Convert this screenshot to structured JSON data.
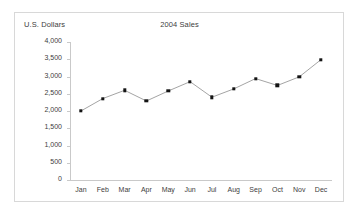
{
  "chart_data": {
    "type": "line",
    "title": "2004 Sales",
    "xlabel": "",
    "ylabel": "U.S. Dollars",
    "categories": [
      "Jan",
      "Feb",
      "Mar",
      "Apr",
      "May",
      "Jun",
      "Jul",
      "Aug",
      "Sep",
      "Oct",
      "Nov",
      "Dec"
    ],
    "values": [
      2000,
      2360,
      2600,
      2290,
      2580,
      2850,
      2400,
      2640,
      2940,
      2740,
      2990,
      3490
    ],
    "series": [
      {
        "name": "2004 Sales",
        "values": [
          2000,
          2360,
          2600,
          2290,
          2580,
          2850,
          2400,
          2640,
          2940,
          2740,
          2990,
          3490
        ]
      }
    ],
    "ylim": [
      0,
      4000
    ],
    "ytick_values": [
      4000,
      3500,
      3000,
      2500,
      2000,
      1500,
      1000,
      500,
      0
    ],
    "ytick_labels": [
      "4,000",
      "3,500",
      "3,000",
      "2,500",
      "2,000",
      "1,500",
      "1,000",
      "500",
      "0"
    ],
    "grid": false,
    "legend": false,
    "marker": "square",
    "colors": {
      "line": "#9a9a9a",
      "marker": "#141414",
      "axis": "#c9c9c9",
      "text": "#404040",
      "frame": "#d8d8d8",
      "background": "#ffffff"
    }
  }
}
